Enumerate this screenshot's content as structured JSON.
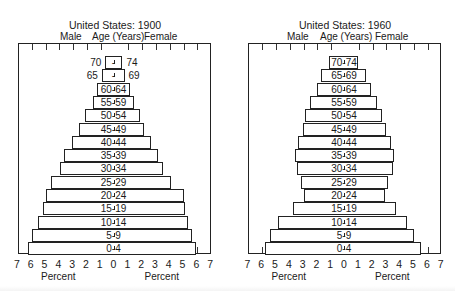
{
  "chart_data": [
    {
      "type": "bar",
      "subtype": "population-pyramid",
      "title": "United States: 1900",
      "header_left": "Male",
      "header_center": "Age (Years)",
      "header_right": "Female",
      "xlabel_left": "Percent",
      "xlabel_right": "Percent",
      "xticks": [
        "7",
        "6",
        "5",
        "4",
        "3",
        "2",
        "1",
        "0",
        "1",
        "2",
        "3",
        "4",
        "5",
        "6",
        "7"
      ],
      "xlim": [
        -7,
        7
      ],
      "categories": [
        "70-74",
        "65-69",
        "60-64",
        "55-59",
        "50-54",
        "45-49",
        "40-44",
        "35-39",
        "30-34",
        "25-29",
        "20-24",
        "15-19",
        "10-14",
        "5-9",
        "0-4"
      ],
      "category_display": [
        "-",
        "-",
        "60-64",
        "55-59",
        "50-54",
        "45-49",
        "40-44",
        "35-39",
        "30-34",
        "25-29",
        "20-24",
        "15-19",
        "10-14",
        "5-9",
        "0-4"
      ],
      "outside_labels": {
        "70-74": [
          "70",
          "74"
        ],
        "65-69": [
          "65",
          "69"
        ]
      },
      "series": [
        {
          "name": "Male",
          "values": [
            0.6,
            0.85,
            1.2,
            1.5,
            2.1,
            2.5,
            3.0,
            3.6,
            3.9,
            4.5,
            4.9,
            5.1,
            5.5,
            5.9,
            6.2
          ]
        },
        {
          "name": "Female",
          "values": [
            0.65,
            0.8,
            1.2,
            1.45,
            1.9,
            2.2,
            2.7,
            3.2,
            3.6,
            4.2,
            5.1,
            5.2,
            5.4,
            5.7,
            6.0
          ]
        }
      ],
      "grid": false
    },
    {
      "type": "bar",
      "subtype": "population-pyramid",
      "title": "United States: 1960",
      "header_left": "Male",
      "header_center": "Age (Years)",
      "header_right": "Female",
      "xlabel_left": "Percent",
      "xlabel_right": "Percent",
      "xticks": [
        "7",
        "6",
        "5",
        "4",
        "3",
        "2",
        "1",
        "0",
        "1",
        "2",
        "3",
        "4",
        "5",
        "6",
        "7"
      ],
      "xlim": [
        -7,
        7
      ],
      "categories": [
        "70-74",
        "65-69",
        "60-64",
        "55-59",
        "50-54",
        "45-49",
        "40-44",
        "35-39",
        "30-34",
        "25-29",
        "20-24",
        "15-19",
        "10-14",
        "5-9",
        "0-4"
      ],
      "category_display": [
        "70-74",
        "65-69",
        "60-64",
        "55-59",
        "50-54",
        "45-49",
        "40-44",
        "35-39",
        "30-34",
        "25-29",
        "20-24",
        "15-19",
        "10-14",
        "5-9",
        "0-4"
      ],
      "series": [
        {
          "name": "Male",
          "values": [
            1.1,
            1.65,
            1.95,
            2.45,
            2.8,
            3.0,
            3.3,
            3.55,
            3.4,
            3.1,
            2.9,
            3.7,
            4.8,
            5.35,
            5.7
          ]
        },
        {
          "name": "Female",
          "values": [
            1.0,
            1.6,
            1.95,
            2.4,
            2.75,
            3.05,
            3.4,
            3.6,
            3.55,
            3.2,
            3.0,
            3.75,
            4.6,
            5.1,
            5.6
          ]
        }
      ],
      "grid": false
    }
  ]
}
